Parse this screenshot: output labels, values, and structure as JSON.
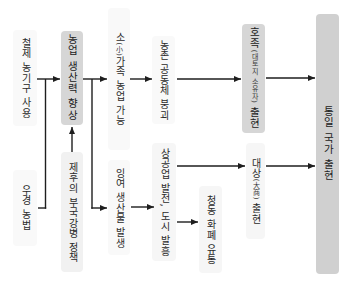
{
  "diagram": {
    "nodes": {
      "iron_tools": {
        "text": "철제 농기구 사용"
      },
      "ox_plowing": {
        "text": "우경 농법"
      },
      "agri_productivity": {
        "text": "농업 생산력 향상"
      },
      "feudal_policy": {
        "text": "제후의 부국강병 정책"
      },
      "small_family": {
        "pre": "소",
        "note": "(小)",
        "post": "가족 농업 가능"
      },
      "surplus": {
        "text": "잉여 생산물 발생"
      },
      "village_collapse": {
        "text": "농촌 공동체 붕괴"
      },
      "commerce_cities": {
        "text": "상공업 발전, 도시 발흥"
      },
      "bronze_currency": {
        "text": "청동 화폐 유통"
      },
      "gentry": {
        "pre": "호족",
        "note": "(대토지 소유자)",
        "post": " 출현"
      },
      "merchants": {
        "pre": "대상",
        "note": "(大商)",
        "post": " 출현"
      },
      "unified_state": {
        "text": "통일 국가 출현"
      }
    },
    "edges": [
      {
        "from": "iron_tools",
        "to": "agri_productivity"
      },
      {
        "from": "ox_plowing",
        "to": "agri_productivity"
      },
      {
        "from": "feudal_policy",
        "to": "agri_productivity"
      },
      {
        "from": "agri_productivity",
        "to": "small_family"
      },
      {
        "from": "agri_productivity",
        "to": "surplus"
      },
      {
        "from": "small_family",
        "to": "village_collapse"
      },
      {
        "from": "surplus",
        "to": "commerce_cities"
      },
      {
        "from": "village_collapse",
        "to": "gentry"
      },
      {
        "from": "commerce_cities",
        "to": "merchants"
      },
      {
        "from": "commerce_cities",
        "to": "bronze_currency"
      },
      {
        "from": "gentry",
        "to": "unified_state"
      },
      {
        "from": "merchants",
        "to": "unified_state"
      }
    ]
  },
  "colors": {
    "highlight": "#d6d6d6",
    "unified": "#d0d0d0",
    "line": "#1e1e1e",
    "text": "#2a2a2a"
  }
}
